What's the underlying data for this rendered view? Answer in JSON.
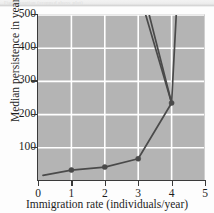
{
  "figure": {
    "caption_remnant": "Figure caption (cropped above plot)"
  },
  "chart_data": {
    "type": "line",
    "title": "",
    "xlabel": "Immigration rate (individuals/year)",
    "ylabel": "Median persistence in years",
    "xlim": [
      0,
      5
    ],
    "ylim": [
      0,
      500
    ],
    "xticks": [
      0,
      1,
      2,
      3,
      4,
      5
    ],
    "xtick_labels": [
      "0",
      "1",
      "2",
      "3",
      "4",
      "5"
    ],
    "yticks": [
      100,
      200,
      300,
      400,
      500
    ],
    "ytick_labels": [
      "100",
      "200",
      "300",
      "400",
      "500"
    ],
    "grid": true,
    "grid_color": "#ffffff",
    "plot_background": "#b4b4b4",
    "legend": "none",
    "line_color": "#4a4a4a",
    "marker_color": "#4a4a4a",
    "series": [
      {
        "name": "Median persistence",
        "marker": "circle",
        "x": [
          0.15,
          1,
          2,
          3,
          4
        ],
        "values": [
          17,
          33,
          42,
          67,
          235
        ]
      },
      {
        "name": "Upper bound (outer)",
        "marker": "none",
        "x": [
          4,
          3.05
        ],
        "values": [
          235,
          560
        ]
      },
      {
        "name": "Upper bound (inner)",
        "marker": "none",
        "x": [
          4,
          3.18
        ],
        "values": [
          235,
          560
        ]
      },
      {
        "name": "Upper branch (right)",
        "marker": "none",
        "x": [
          4,
          4.17
        ],
        "values": [
          235,
          560
        ]
      }
    ]
  }
}
